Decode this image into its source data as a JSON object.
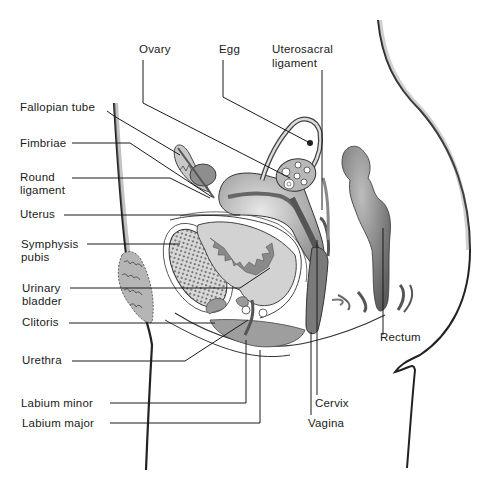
{
  "diagram": {
    "labels": {
      "ovary": "Ovary",
      "egg": "Egg",
      "uterosacral_1": "Uterosacral",
      "uterosacral_2": "ligament",
      "fallopian_tube": "Fallopian tube",
      "fimbriae": "Fimbriae",
      "round_1": "Round",
      "round_2": "ligament",
      "uterus": "Uterus",
      "symphysis_1": "Symphysis",
      "symphysis_2": "pubis",
      "bladder_1": "Urinary",
      "bladder_2": "bladder",
      "clitoris": "Clitoris",
      "urethra": "Urethra",
      "labium_minor": "Labium minor",
      "labium_major": "Labium major",
      "rectum": "Rectum",
      "cervix": "Cervix",
      "vagina": "Vagina"
    },
    "colors": {
      "background": "#ffffff",
      "line": "#1a1a1a",
      "tissue_dark": "#6e6e6e",
      "tissue_mid": "#9a9a9a",
      "tissue_light": "#cfcfcf"
    }
  }
}
